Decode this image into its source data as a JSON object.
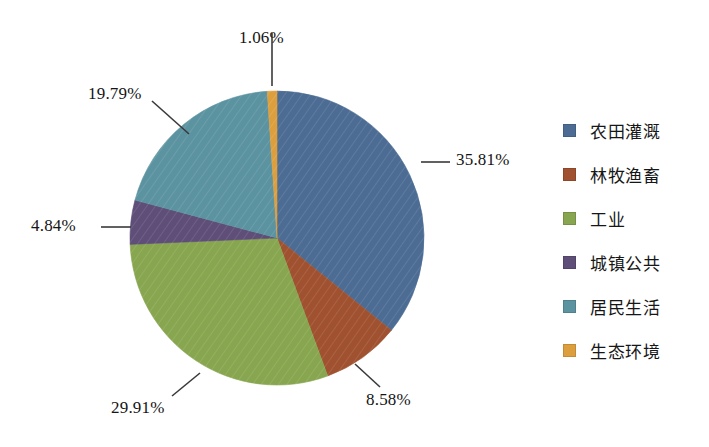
{
  "chart_data": {
    "type": "pie",
    "title": "",
    "subtitle": "",
    "xlabel": "",
    "ylabel": "",
    "legend_position": "right",
    "grid": false,
    "units": "%",
    "start_angle_deg": 0,
    "direction": "clockwise",
    "categories": [
      "农田灌溉",
      "林牧渔畜",
      "工业",
      "城镇公共",
      "居民生活",
      "生态环境"
    ],
    "values": [
      35.81,
      8.58,
      29.91,
      4.84,
      19.79,
      1.06
    ],
    "colors": [
      "#4c6c94",
      "#a0512f",
      "#87a64f",
      "#5e4e78",
      "#5b93a0",
      "#dd9f3e"
    ],
    "slices": [
      {
        "label": "农田灌溉",
        "value": 35.81,
        "display": "35.81%",
        "color": "#4c6c94"
      },
      {
        "label": "林牧渔畜",
        "value": 8.58,
        "display": "8.58%",
        "color": "#a0512f"
      },
      {
        "label": "工业",
        "value": 29.91,
        "display": "29.91%",
        "color": "#87a64f"
      },
      {
        "label": "城镇公共",
        "value": 4.84,
        "display": "4.84%",
        "color": "#5e4e78"
      },
      {
        "label": "居民生活",
        "value": 19.79,
        "display": "19.79%",
        "color": "#5b93a0"
      },
      {
        "label": "生态环境",
        "value": 1.06,
        "display": "1.06%",
        "color": "#dd9f3e"
      }
    ],
    "annotations": [
      {
        "text": "1.06%",
        "target": "生态环境"
      },
      {
        "text": "19.79%",
        "target": "居民生活"
      },
      {
        "text": "4.84%",
        "target": "城镇公共"
      },
      {
        "text": "29.91%",
        "target": "工业"
      },
      {
        "text": "8.58%",
        "target": "林牧渔畜"
      },
      {
        "text": "35.81%",
        "target": "农田灌溉"
      }
    ]
  },
  "labels": {
    "eco": "1.06%",
    "residential": "19.79%",
    "urban_public": "4.84%",
    "industry": "29.91%",
    "forestry": "8.58%",
    "irrigation": "35.81%"
  },
  "legend": {
    "items": [
      {
        "label": "农田灌溉",
        "color": "#4c6c94"
      },
      {
        "label": "林牧渔畜",
        "color": "#a0512f"
      },
      {
        "label": "工业",
        "color": "#87a64f"
      },
      {
        "label": "城镇公共",
        "color": "#5e4e78"
      },
      {
        "label": "居民生活",
        "color": "#5b93a0"
      },
      {
        "label": "生态环境",
        "color": "#dd9f3e"
      }
    ]
  }
}
